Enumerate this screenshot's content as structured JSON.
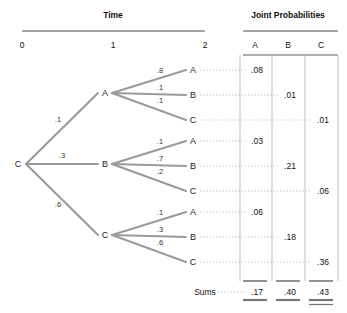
{
  "headers": {
    "time": "Time",
    "joint": "Joint Probabilities",
    "time_ticks": [
      "0",
      "1",
      "2"
    ],
    "columns": [
      "A",
      "B",
      "C"
    ]
  },
  "tree": {
    "root": {
      "label": "C"
    },
    "level1": [
      {
        "label": "A",
        "prob": ".1"
      },
      {
        "label": "B",
        "prob": ".3"
      },
      {
        "label": "C",
        "prob": ".6"
      }
    ],
    "level2": [
      {
        "label": "A",
        "prob": ".8",
        "joint": ".08",
        "column": "A"
      },
      {
        "label": "B",
        "prob": ".1",
        "joint": ".01",
        "column": "B"
      },
      {
        "label": "C",
        "prob": ".1",
        "joint": ".01",
        "column": "C"
      },
      {
        "label": "A",
        "prob": ".1",
        "joint": ".03",
        "column": "A"
      },
      {
        "label": "B",
        "prob": ".7",
        "joint": ".21",
        "column": "B"
      },
      {
        "label": "C",
        "prob": ".2",
        "joint": ".06",
        "column": "C"
      },
      {
        "label": "A",
        "prob": ".1",
        "joint": ".06",
        "column": "A"
      },
      {
        "label": "B",
        "prob": ".3",
        "joint": ".18",
        "column": "B"
      },
      {
        "label": "C",
        "prob": ".6",
        "joint": ".36",
        "column": "C"
      }
    ]
  },
  "sums": {
    "label": "Sums",
    "values": [
      ".17",
      ".40",
      ".43"
    ]
  },
  "colors": {
    "branch": "#9a9a9a",
    "rule": "#4a4a4a",
    "divider": "#b8b8b8",
    "dots": "#b0b0b0"
  }
}
